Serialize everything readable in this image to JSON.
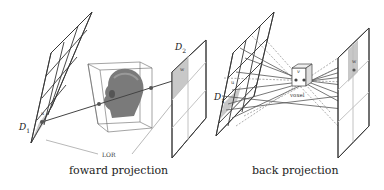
{
  "forward": {
    "caption": "foward projection",
    "detector1_label": "D",
    "detector1_sub": "1",
    "detector2_label": "D",
    "detector2_sub": "2",
    "lor_label": "LOR",
    "bin_label_top": "u",
    "bin_label_bottom": "w"
  },
  "back": {
    "caption": "back projection",
    "detector1_label": "D",
    "detector1_sub": "1",
    "voxel_label": "voxel",
    "voxel_symbol": "v",
    "bin_label_top": "u",
    "bin_label_bottom": "w"
  },
  "colors": {
    "line": "#333333",
    "shade": "#c8c8c8",
    "head": "#7a7a7a"
  }
}
